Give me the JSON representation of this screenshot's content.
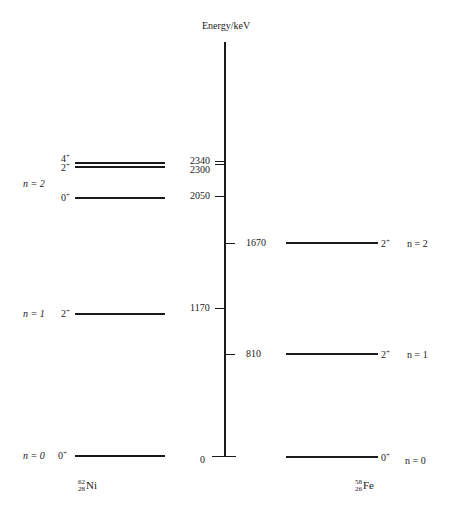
{
  "axis": {
    "label": "Energy/keV"
  },
  "ticks": [
    {
      "value": "2340",
      "side": "left"
    },
    {
      "value": "2300",
      "side": "left"
    },
    {
      "value": "2050",
      "side": "left"
    },
    {
      "value": "1670",
      "side": "right"
    },
    {
      "value": "1170",
      "side": "left"
    },
    {
      "value": "810",
      "side": "right"
    },
    {
      "value": "0",
      "side": "left"
    }
  ],
  "ni62": {
    "nucleus": {
      "symbol": "Ni",
      "mass": "62",
      "atomic": "28"
    },
    "levels": [
      {
        "spin": "4",
        "parity": "+",
        "energy": 2340
      },
      {
        "spin": "2",
        "parity": "+",
        "energy": 2300
      },
      {
        "spin": "0",
        "parity": "+",
        "energy": 2050
      },
      {
        "spin": "2",
        "parity": "+",
        "energy": 1170
      },
      {
        "spin": "0",
        "parity": "+",
        "energy": 0
      }
    ],
    "phonon_labels": [
      "n = 2",
      "n = 1",
      "n = 0"
    ]
  },
  "fe58": {
    "nucleus": {
      "symbol": "Fe",
      "mass": "58",
      "atomic": "26"
    },
    "levels": [
      {
        "spin": "2",
        "parity": "+",
        "energy": 1670
      },
      {
        "spin": "2",
        "parity": "+",
        "energy": 810
      },
      {
        "spin": "0",
        "parity": "+",
        "energy": 0
      }
    ],
    "phonon_labels": [
      "n = 2",
      "n = 1",
      "n = 0"
    ]
  }
}
